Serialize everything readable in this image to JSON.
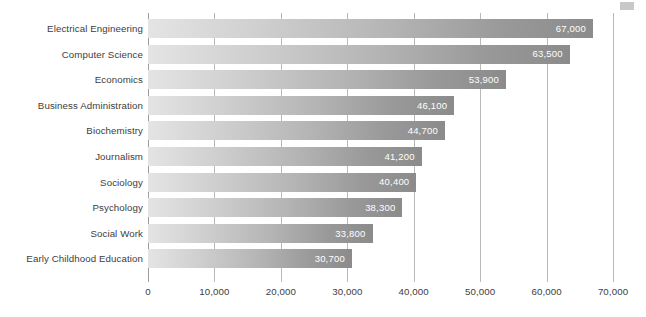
{
  "chart_data": {
    "type": "bar",
    "orientation": "horizontal",
    "title": "",
    "subtitle": "",
    "xlabel": "",
    "ylabel": "",
    "categories": [
      "Electrical Engineering",
      "Computer Science",
      "Economics",
      "Business Administration",
      "Biochemistry",
      "Journalism",
      "Sociology",
      "Psychology",
      "Social Work",
      "Early Childhood Education"
    ],
    "values": [
      67000,
      63500,
      53900,
      46100,
      44700,
      41200,
      40400,
      38300,
      33800,
      30700
    ],
    "value_labels": [
      "67,000",
      "63,500",
      "53,900",
      "46,100",
      "44,700",
      "41,200",
      "40,400",
      "38,300",
      "33,800",
      "30,700"
    ],
    "xlim": [
      0,
      70000
    ],
    "xticks": [
      0,
      10000,
      20000,
      30000,
      40000,
      50000,
      60000,
      70000
    ],
    "xtick_labels": [
      "0",
      "10,000",
      "20,000",
      "30,000",
      "40,000",
      "50,000",
      "60,000",
      "70,000"
    ],
    "grid": "vertical",
    "legend": "none",
    "colors": {
      "bar_gradient_start": "#e4e4e4",
      "bar_gradient_end": "#8b8b8b",
      "gridline": "#b9b9b9",
      "axis": "#9d9d9d",
      "label_text": "#3d3d3d",
      "value_text": "#ffffff",
      "background": "#ffffff"
    }
  }
}
